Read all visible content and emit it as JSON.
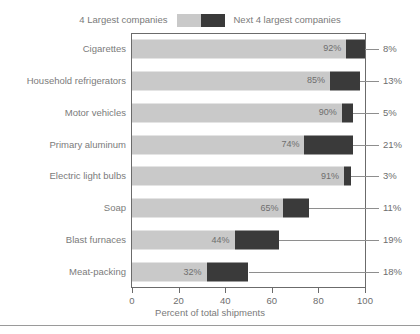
{
  "legend": {
    "left_label": "4 Largest companies",
    "right_label": "Next 4 largest companies",
    "light_color": "#c9c9c9",
    "dark_color": "#3a3a3a"
  },
  "axis": {
    "title": "Percent of total shipments",
    "ticks": [
      "0",
      "20",
      "40",
      "60",
      "80",
      "100"
    ]
  },
  "chart_data": {
    "type": "bar",
    "orientation": "horizontal",
    "stacked": true,
    "title": "",
    "xlabel": "Percent of total shipments",
    "ylabel": "",
    "xlim": [
      0,
      100
    ],
    "xticks": [
      0,
      20,
      40,
      60,
      80,
      100
    ],
    "grid": false,
    "legend_position": "top",
    "categories": [
      "Cigarettes",
      "Household refrigerators",
      "Motor vehicles",
      "Primary aluminum",
      "Electric light bulbs",
      "Soap",
      "Blast furnaces",
      "Meat-packing"
    ],
    "series": [
      {
        "name": "4 Largest companies",
        "color": "#c9c9c9",
        "values": [
          92,
          85,
          90,
          74,
          91,
          65,
          44,
          32
        ],
        "labels": [
          "92%",
          "85%",
          "90%",
          "74%",
          "91%",
          "65%",
          "44%",
          "32%"
        ]
      },
      {
        "name": "Next 4 largest companies",
        "color": "#3a3a3a",
        "values": [
          8,
          13,
          5,
          21,
          3,
          11,
          19,
          18
        ],
        "labels": [
          "8%",
          "13%",
          "5%",
          "21%",
          "3%",
          "11%",
          "19%",
          "18%"
        ]
      }
    ]
  }
}
